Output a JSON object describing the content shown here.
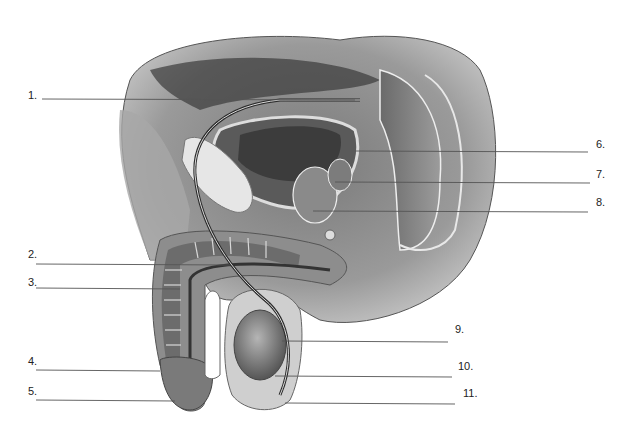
{
  "diagram": {
    "type": "anatomical-illustration",
    "colors": {
      "background": "#ffffff",
      "ink": "#333333",
      "leader_line": "#555555"
    },
    "labels": [
      {
        "id": 1,
        "text": "1.",
        "x": 28,
        "y": 89,
        "line": {
          "x1": 42,
          "y1": 99,
          "x2": 355,
          "y2": 100
        }
      },
      {
        "id": 2,
        "text": "2.",
        "x": 28,
        "y": 248,
        "line": {
          "x1": 36,
          "y1": 264,
          "x2": 230,
          "y2": 265
        }
      },
      {
        "id": 3,
        "text": "3.",
        "x": 28,
        "y": 276,
        "line": {
          "x1": 36,
          "y1": 288,
          "x2": 180,
          "y2": 289
        }
      },
      {
        "id": 4,
        "text": "4.",
        "x": 28,
        "y": 355,
        "line": {
          "x1": 36,
          "y1": 370,
          "x2": 160,
          "y2": 371
        }
      },
      {
        "id": 5,
        "text": "5.",
        "x": 28,
        "y": 385,
        "line": {
          "x1": 36,
          "y1": 400,
          "x2": 175,
          "y2": 401
        }
      },
      {
        "id": 6,
        "text": "6.",
        "x": 596,
        "y": 138,
        "line": {
          "x1": 356,
          "y1": 151,
          "x2": 588,
          "y2": 152
        }
      },
      {
        "id": 7,
        "text": "7.",
        "x": 596,
        "y": 168,
        "line": {
          "x1": 335,
          "y1": 182,
          "x2": 590,
          "y2": 183
        }
      },
      {
        "id": 8,
        "text": "8.",
        "x": 596,
        "y": 196,
        "line": {
          "x1": 313,
          "y1": 211,
          "x2": 588,
          "y2": 212
        }
      },
      {
        "id": 9,
        "text": "9.",
        "x": 455,
        "y": 323,
        "line": {
          "x1": 282,
          "y1": 341,
          "x2": 448,
          "y2": 342
        }
      },
      {
        "id": 10,
        "text": "10.",
        "x": 458,
        "y": 360,
        "line": {
          "x1": 275,
          "y1": 376,
          "x2": 452,
          "y2": 377
        }
      },
      {
        "id": 11,
        "text": "11.",
        "x": 463,
        "y": 387,
        "line": {
          "x1": 285,
          "y1": 403,
          "x2": 455,
          "y2": 404
        }
      }
    ]
  }
}
